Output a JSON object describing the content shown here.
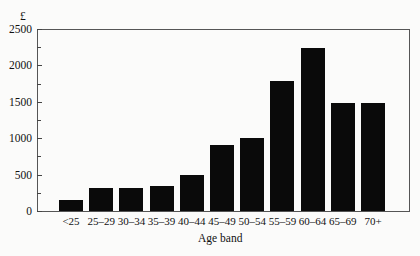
{
  "chart_data": {
    "type": "bar",
    "title": "",
    "xlabel": "Age band",
    "ylabel": "£",
    "ylim": [
      0,
      2500
    ],
    "yticks": [
      0,
      500,
      1000,
      1500,
      2000,
      2500
    ],
    "ytick_labels": [
      "0",
      "500",
      "1000",
      "1500",
      "2000",
      "2500"
    ],
    "minor_yticks": [
      250,
      750,
      1250,
      1750,
      2250
    ],
    "grid": false,
    "legend": null,
    "categories": [
      "<25",
      "25–29",
      "30–34",
      "35–39",
      "40–44",
      "45–49",
      "50–54",
      "55–59",
      "60–64",
      "65–69",
      "70+"
    ],
    "values": [
      150,
      310,
      320,
      350,
      500,
      900,
      1000,
      1780,
      2240,
      1480,
      1480
    ],
    "bar_color": "#0a0a0a"
  }
}
